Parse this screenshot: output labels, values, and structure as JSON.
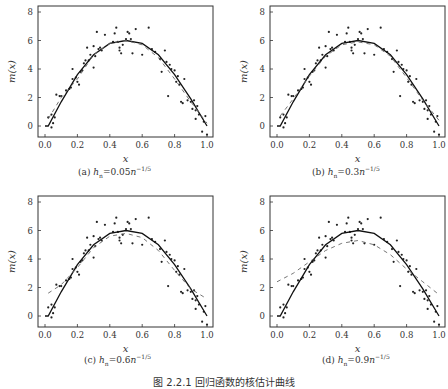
{
  "figure": {
    "caption": "图 2.2.1  回归函数的核估计曲线"
  },
  "panels": [
    {
      "id": "a",
      "label": "(a)",
      "h_coef": "0.05",
      "h_text": "h_n = 0.05n^{-1/5}"
    },
    {
      "id": "b",
      "label": "(b)",
      "h_coef": "0.3",
      "h_text": "h_n = 0.3n^{-1/5}"
    },
    {
      "id": "c",
      "label": "(c)",
      "h_coef": "0.6",
      "h_text": "h_n = 0.6n^{-1/5}"
    },
    {
      "id": "d",
      "label": "(d)",
      "h_coef": "0.9",
      "h_text": "h_n = 0.9n^{-1/5}"
    }
  ],
  "chart_data": [
    {
      "type": "scatter",
      "title": "(a) h_n=0.05n^{-1/5}",
      "xlabel": "x",
      "ylabel": "m(x)",
      "xlim": [
        0,
        1
      ],
      "ylim": [
        -0.8,
        8.3
      ],
      "xticks": [
        "0.0",
        "0.2",
        "0.4",
        "0.6",
        "0.8",
        "1.0"
      ],
      "yticks": [
        "0",
        "2",
        "4",
        "6",
        "8"
      ],
      "series": [
        {
          "name": "true m(x)",
          "style": "solid",
          "x": [
            0,
            0.02,
            0.1,
            0.2,
            0.3,
            0.4,
            0.5,
            0.6,
            0.7,
            0.8,
            0.9,
            1.0
          ],
          "y": [
            0,
            0,
            1.7,
            3.6,
            5.0,
            5.8,
            6.0,
            5.8,
            5.0,
            3.6,
            1.9,
            0
          ]
        },
        {
          "name": "kernel estimate",
          "style": "dashed",
          "x": [
            0.02,
            0.1,
            0.2,
            0.3,
            0.4,
            0.5,
            0.6,
            0.7,
            0.8,
            0.9,
            1.0
          ],
          "y": [
            0.5,
            2.0,
            3.3,
            5.0,
            5.8,
            6.0,
            5.7,
            4.8,
            3.3,
            1.7,
            0.2
          ]
        }
      ]
    },
    {
      "type": "scatter",
      "title": "(b) h_n=0.3n^{-1/5}",
      "xlabel": "x",
      "ylabel": "m(x)",
      "xlim": [
        0,
        1
      ],
      "ylim": [
        -0.8,
        8.3
      ],
      "xticks": [
        "0.0",
        "0.2",
        "0.4",
        "0.6",
        "0.8",
        "1.0"
      ],
      "yticks": [
        "0",
        "2",
        "4",
        "6",
        "8"
      ],
      "series": [
        {
          "name": "true m(x)",
          "style": "solid",
          "x": [
            0,
            0.02,
            0.1,
            0.2,
            0.3,
            0.4,
            0.5,
            0.6,
            0.7,
            0.8,
            0.9,
            1.0
          ],
          "y": [
            0,
            0,
            1.7,
            3.6,
            5.0,
            5.8,
            6.0,
            5.8,
            5.0,
            3.6,
            1.9,
            0
          ]
        },
        {
          "name": "kernel estimate",
          "style": "dashed",
          "x": [
            0.02,
            0.1,
            0.2,
            0.3,
            0.4,
            0.5,
            0.6,
            0.7,
            0.8,
            0.9,
            1.0
          ],
          "y": [
            0.7,
            1.9,
            3.5,
            4.9,
            5.7,
            5.9,
            5.7,
            4.9,
            3.4,
            1.8,
            0.4
          ]
        }
      ]
    },
    {
      "type": "scatter",
      "title": "(c) h_n=0.6n^{-1/5}",
      "xlabel": "x",
      "ylabel": "m(x)",
      "xlim": [
        0,
        1
      ],
      "ylim": [
        -0.8,
        8.3
      ],
      "xticks": [
        "0.0",
        "0.2",
        "0.4",
        "0.6",
        "0.8",
        "1.0"
      ],
      "yticks": [
        "0",
        "2",
        "4",
        "6",
        "8"
      ],
      "series": [
        {
          "name": "true m(x)",
          "style": "solid",
          "x": [
            0,
            0.02,
            0.1,
            0.2,
            0.3,
            0.4,
            0.5,
            0.6,
            0.7,
            0.8,
            0.9,
            1.0
          ],
          "y": [
            0,
            0,
            1.7,
            3.6,
            5.0,
            5.8,
            6.0,
            5.8,
            5.0,
            3.6,
            1.9,
            0
          ]
        },
        {
          "name": "kernel estimate",
          "style": "dashed",
          "x": [
            0.02,
            0.1,
            0.2,
            0.3,
            0.4,
            0.5,
            0.6,
            0.7,
            0.8,
            0.9,
            1.0
          ],
          "y": [
            1.6,
            2.2,
            3.4,
            4.8,
            5.6,
            5.8,
            5.5,
            4.6,
            3.2,
            1.9,
            1.2
          ]
        }
      ]
    },
    {
      "type": "scatter",
      "title": "(d) h_n=0.9n^{-1/5}",
      "xlabel": "x",
      "ylabel": "m(x)",
      "xlim": [
        0,
        1
      ],
      "ylim": [
        -0.8,
        8.3
      ],
      "xticks": [
        "0.0",
        "0.2",
        "0.4",
        "0.6",
        "0.8",
        "1.0"
      ],
      "yticks": [
        "0",
        "2",
        "4",
        "6",
        "8"
      ],
      "series": [
        {
          "name": "true m(x)",
          "style": "solid",
          "x": [
            0,
            0.02,
            0.1,
            0.2,
            0.3,
            0.4,
            0.5,
            0.6,
            0.7,
            0.8,
            0.9,
            1.0
          ],
          "y": [
            0,
            0,
            1.7,
            3.6,
            5.0,
            5.8,
            6.0,
            5.8,
            5.0,
            3.6,
            1.9,
            0
          ]
        },
        {
          "name": "kernel estimate",
          "style": "dashed",
          "x": [
            0.0,
            0.1,
            0.2,
            0.3,
            0.4,
            0.5,
            0.6,
            0.7,
            0.8,
            0.9,
            1.0
          ],
          "y": [
            2.4,
            3.0,
            3.8,
            4.6,
            5.1,
            5.3,
            5.0,
            4.3,
            3.3,
            2.4,
            1.5
          ]
        }
      ]
    }
  ],
  "scatter_points": {
    "x": [
      0.02,
      0.04,
      0.04,
      0.05,
      0.06,
      0.07,
      0.09,
      0.1,
      0.13,
      0.15,
      0.16,
      0.17,
      0.17,
      0.19,
      0.2,
      0.21,
      0.22,
      0.23,
      0.24,
      0.25,
      0.26,
      0.27,
      0.28,
      0.3,
      0.3,
      0.31,
      0.32,
      0.33,
      0.34,
      0.35,
      0.37,
      0.42,
      0.43,
      0.44,
      0.45,
      0.46,
      0.46,
      0.47,
      0.48,
      0.5,
      0.51,
      0.52,
      0.53,
      0.54,
      0.56,
      0.6,
      0.64,
      0.66,
      0.68,
      0.71,
      0.72,
      0.74,
      0.75,
      0.76,
      0.77,
      0.78,
      0.8,
      0.81,
      0.82,
      0.83,
      0.84,
      0.85,
      0.86,
      0.88,
      0.9,
      0.91,
      0.92,
      0.93,
      0.93,
      0.94,
      0.95,
      0.97,
      0.98,
      0.99,
      1.0
    ],
    "y": [
      0.6,
      0.8,
      -0.1,
      0.2,
      0.6,
      2.2,
      2.1,
      2.1,
      2.5,
      2.6,
      2.7,
      3.3,
      4.0,
      3.4,
      3.1,
      2.9,
      3.8,
      3.9,
      4.4,
      4.6,
      5.5,
      4.6,
      5.0,
      4.1,
      5.6,
      4.9,
      6.6,
      5.4,
      5.5,
      5.3,
      6.4,
      5.9,
      6.5,
      6.9,
      5.9,
      5.5,
      5.3,
      5.1,
      5.7,
      6.1,
      6.6,
      6.5,
      6.1,
      5.1,
      6.8,
      5.0,
      6.9,
      5.4,
      5.2,
      4.7,
      3.8,
      5.3,
      4.5,
      2.1,
      4.3,
      4.0,
      3.9,
      3.1,
      3.5,
      2.9,
      1.7,
      1.6,
      3.3,
      1.8,
      1.7,
      1.2,
      1.8,
      1.1,
      0.5,
      1.4,
      0.8,
      -0.4,
      0.3,
      0.7,
      -0.6
    ]
  }
}
